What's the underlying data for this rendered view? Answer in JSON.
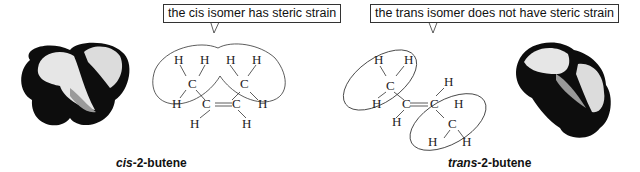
{
  "cis": {
    "callout": "the cis isomer has steric strain",
    "caption_prefix": "cis",
    "caption_suffix": "-2-butene"
  },
  "trans": {
    "callout": "the trans isomer does not have steric strain",
    "caption_prefix": "trans",
    "caption_suffix": "-2-butene"
  },
  "atoms": {
    "H": "H",
    "C": "C"
  },
  "colors": {
    "map_dark": "#0d0d0d",
    "map_light": "#e8e8e8",
    "line": "#333333"
  }
}
